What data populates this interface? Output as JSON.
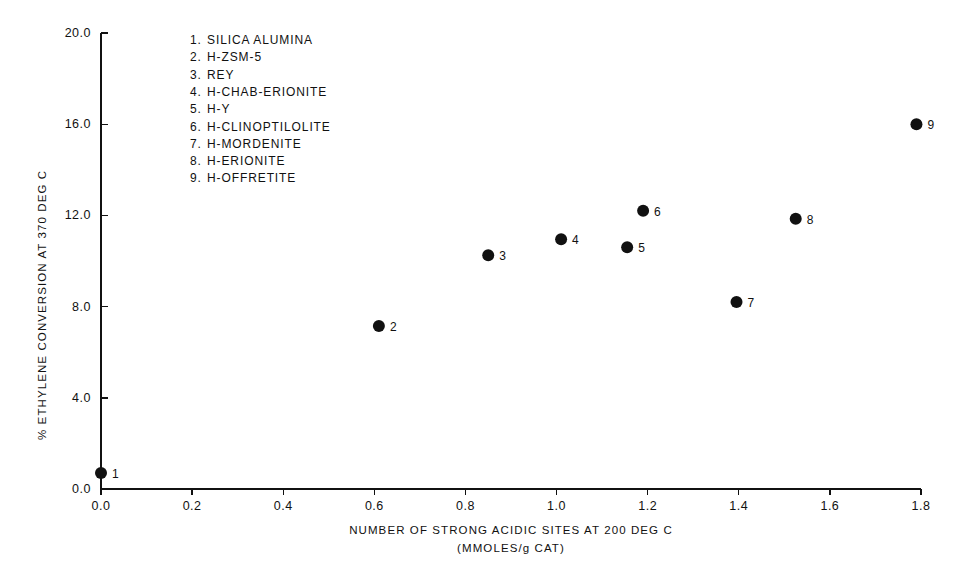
{
  "chart_data": {
    "type": "scatter",
    "title": "",
    "xlabel": "NUMBER OF STRONG ACIDIC SITES AT 200 DEG C",
    "xlabel_units": "(MMOLES/g CAT)",
    "ylabel": "% ETHYLENE CONVERSION AT 370 DEG C",
    "xlim": [
      0.0,
      1.8
    ],
    "ylim": [
      0.0,
      20.0
    ],
    "xticks": [
      "0.0",
      "0.2",
      "0.4",
      "0.6",
      "0.8",
      "1.0",
      "1.2",
      "1.4",
      "1.6",
      "1.8"
    ],
    "xtick_values": [
      0.0,
      0.2,
      0.4,
      0.6,
      0.8,
      1.0,
      1.2,
      1.4,
      1.6,
      1.8
    ],
    "yticks": [
      "0.0",
      "4.0",
      "8.0",
      "12.0",
      "16.0",
      "20.0"
    ],
    "ytick_values": [
      0.0,
      4.0,
      8.0,
      12.0,
      16.0,
      20.0
    ],
    "grid": false,
    "legend_position": "upper-left-inside",
    "marker": "filled-circle",
    "marker_color": "#111111",
    "points": [
      {
        "id": "1",
        "label": "SILICA ALUMINA",
        "x": 0.0,
        "y": 0.7,
        "anno": "1",
        "anno_side": "right"
      },
      {
        "id": "2",
        "label": "H-ZSM-5",
        "x": 0.61,
        "y": 7.15,
        "anno": "2",
        "anno_side": "right"
      },
      {
        "id": "3",
        "label": "REY",
        "x": 0.85,
        "y": 10.25,
        "anno": "3",
        "anno_side": "right"
      },
      {
        "id": "4",
        "label": "H-CHAB-ERIONITE",
        "x": 1.01,
        "y": 10.95,
        "anno": "4",
        "anno_side": "right"
      },
      {
        "id": "5",
        "label": "H-Y",
        "x": 1.155,
        "y": 10.6,
        "anno": "5",
        "anno_side": "right"
      },
      {
        "id": "6",
        "label": "H-CLINOPTILOLITE",
        "x": 1.19,
        "y": 12.2,
        "anno": "6",
        "anno_side": "right"
      },
      {
        "id": "7",
        "label": "H-MORDENITE",
        "x": 1.395,
        "y": 8.2,
        "anno": "7",
        "anno_side": "right"
      },
      {
        "id": "8",
        "label": "H-ERIONITE",
        "x": 1.525,
        "y": 11.85,
        "anno": "8",
        "anno_side": "right"
      },
      {
        "id": "9",
        "label": "H-OFFRETITE",
        "x": 1.79,
        "y": 16.0,
        "anno": "9",
        "anno_side": "right"
      }
    ]
  },
  "legend": {
    "entries": [
      {
        "num": "1.",
        "name": "SILICA ALUMINA"
      },
      {
        "num": "2.",
        "name": "H-ZSM-5"
      },
      {
        "num": "3.",
        "name": "REY"
      },
      {
        "num": "4.",
        "name": "H-CHAB-ERIONITE"
      },
      {
        "num": "5.",
        "name": "H-Y"
      },
      {
        "num": "6.",
        "name": "H-CLINOPTILOLITE"
      },
      {
        "num": "7.",
        "name": "H-MORDENITE"
      },
      {
        "num": "8.",
        "name": "H-ERIONITE"
      },
      {
        "num": "9.",
        "name": "H-OFFRETITE"
      }
    ]
  },
  "colors": {
    "axis": "#111111",
    "marker": "#111111",
    "background": "#ffffff",
    "text": "#111111"
  }
}
